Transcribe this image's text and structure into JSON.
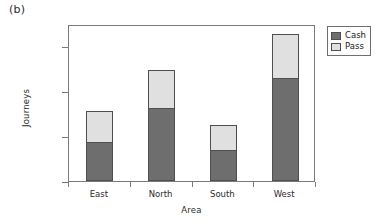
{
  "panel": {
    "label": "(b)"
  },
  "chart_data": {
    "type": "bar",
    "subtype": "stacked-bar",
    "title": "",
    "xlabel": "Area",
    "ylabel": "Journeys",
    "categories": [
      "East",
      "North",
      "South",
      "West"
    ],
    "series": [
      {
        "name": "Cash",
        "color": "#6e6e6e",
        "values": [
          43000,
          81000,
          35000,
          115000
        ]
      },
      {
        "name": "Pass",
        "color": "#e0e0e0",
        "values": [
          35000,
          43000,
          28000,
          49000
        ]
      }
    ],
    "totals": [
      78000,
      124000,
      63000,
      164000
    ],
    "ylim": [
      0,
      175000
    ],
    "yticks": [
      0,
      50000,
      100000,
      150000
    ],
    "ytick_labels": [
      "0",
      "50000",
      "100000",
      "150000"
    ],
    "grid": false,
    "legend_position": "right-top",
    "legend_entries": [
      "Cash",
      "Pass"
    ],
    "stack_order": "cash-bottom-pass-top"
  }
}
